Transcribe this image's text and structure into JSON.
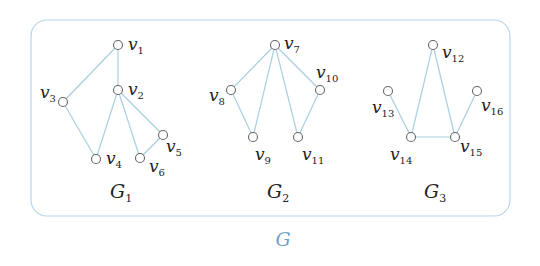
{
  "title": "G",
  "colors": {
    "edge": "#a9cfe0",
    "box": "#b7d6ea",
    "node_stroke": "#666666",
    "text": "#222222",
    "title": "#6fa0c8"
  },
  "container": {
    "x": 31,
    "y": 20,
    "width": 479,
    "height": 196,
    "radius": 16
  },
  "title_position": {
    "x": 283,
    "y": 246
  },
  "subgraphs": [
    {
      "name": "G",
      "subscript": "1",
      "label_x": 118,
      "label_y": 198,
      "nodes": [
        {
          "id": "v1",
          "base": "v",
          "sub": "1",
          "x": 118,
          "y": 45,
          "lx": 128,
          "ly": 50,
          "anchor": "start"
        },
        {
          "id": "v2",
          "base": "v",
          "sub": "2",
          "x": 118,
          "y": 90,
          "lx": 128,
          "ly": 95,
          "anchor": "start"
        },
        {
          "id": "v3",
          "base": "v",
          "sub": "3",
          "x": 63,
          "y": 102,
          "lx": 40,
          "ly": 98,
          "anchor": "start"
        },
        {
          "id": "v4",
          "base": "v",
          "sub": "4",
          "x": 96,
          "y": 159,
          "lx": 106,
          "ly": 164,
          "anchor": "start"
        },
        {
          "id": "v5",
          "base": "v",
          "sub": "5",
          "x": 163,
          "y": 135,
          "lx": 166,
          "ly": 152,
          "anchor": "start"
        },
        {
          "id": "v6",
          "base": "v",
          "sub": "6",
          "x": 140,
          "y": 158,
          "lx": 149,
          "ly": 172,
          "anchor": "start"
        }
      ],
      "edges": [
        [
          "v1",
          "v3"
        ],
        [
          "v1",
          "v2"
        ],
        [
          "v3",
          "v4"
        ],
        [
          "v2",
          "v4"
        ],
        [
          "v2",
          "v6"
        ],
        [
          "v2",
          "v5"
        ],
        [
          "v5",
          "v6"
        ]
      ]
    },
    {
      "name": "G",
      "subscript": "2",
      "label_x": 275,
      "label_y": 198,
      "nodes": [
        {
          "id": "v7",
          "base": "v",
          "sub": "7",
          "x": 275,
          "y": 45,
          "lx": 284,
          "ly": 49,
          "anchor": "start"
        },
        {
          "id": "v8",
          "base": "v",
          "sub": "8",
          "x": 231,
          "y": 90,
          "lx": 209,
          "ly": 101,
          "anchor": "start"
        },
        {
          "id": "v9",
          "base": "v",
          "sub": "9",
          "x": 253,
          "y": 137,
          "lx": 255,
          "ly": 160,
          "anchor": "start"
        },
        {
          "id": "v10",
          "base": "v",
          "sub": "10",
          "x": 320,
          "y": 90,
          "lx": 316,
          "ly": 78,
          "anchor": "start"
        },
        {
          "id": "v11",
          "base": "v",
          "sub": "11",
          "x": 298,
          "y": 137,
          "lx": 302,
          "ly": 160,
          "anchor": "start"
        }
      ],
      "edges": [
        [
          "v7",
          "v8"
        ],
        [
          "v7",
          "v9"
        ],
        [
          "v7",
          "v11"
        ],
        [
          "v7",
          "v10"
        ],
        [
          "v8",
          "v9"
        ],
        [
          "v10",
          "v11"
        ]
      ]
    },
    {
      "name": "G",
      "subscript": "3",
      "label_x": 432,
      "label_y": 198,
      "nodes": [
        {
          "id": "v12",
          "base": "v",
          "sub": "12",
          "x": 433,
          "y": 45,
          "lx": 442,
          "ly": 58,
          "anchor": "start"
        },
        {
          "id": "v13",
          "base": "v",
          "sub": "13",
          "x": 388,
          "y": 91,
          "lx": 372,
          "ly": 113,
          "anchor": "start"
        },
        {
          "id": "v14",
          "base": "v",
          "sub": "14",
          "x": 411,
          "y": 137,
          "lx": 390,
          "ly": 160,
          "anchor": "start"
        },
        {
          "id": "v15",
          "base": "v",
          "sub": "15",
          "x": 455,
          "y": 137,
          "lx": 460,
          "ly": 152,
          "anchor": "start"
        },
        {
          "id": "v16",
          "base": "v",
          "sub": "16",
          "x": 477,
          "y": 91,
          "lx": 481,
          "ly": 111,
          "anchor": "start"
        }
      ],
      "edges": [
        [
          "v12",
          "v14"
        ],
        [
          "v12",
          "v15"
        ],
        [
          "v13",
          "v14"
        ],
        [
          "v14",
          "v15"
        ],
        [
          "v15",
          "v16"
        ]
      ]
    }
  ]
}
